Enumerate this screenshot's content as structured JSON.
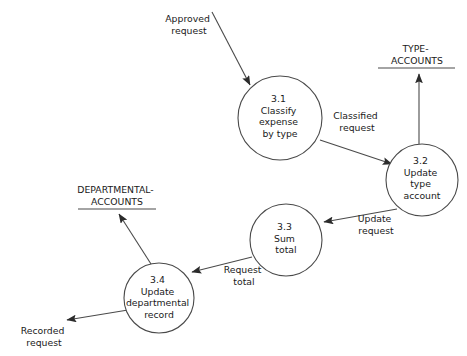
{
  "diagram": {
    "type": "data-flow-diagram",
    "background_color": "#ffffff",
    "line_color": "#4a4a4a",
    "text_color": "#1a1a1a"
  },
  "processes": [
    {
      "id": "3.1",
      "number": "3.1",
      "lines": [
        "3.1",
        "Classify",
        "expense",
        "by type"
      ],
      "cx": 280,
      "cy": 118,
      "r": 42
    },
    {
      "id": "3.2",
      "number": "3.2",
      "lines": [
        "3.2",
        "Update",
        "type",
        "account"
      ],
      "cx": 422,
      "cy": 180,
      "r": 36
    },
    {
      "id": "3.3",
      "number": "3.3",
      "lines": [
        "3.3",
        "Sum",
        "total"
      ],
      "cx": 286,
      "cy": 240,
      "r": 36
    },
    {
      "id": "3.4",
      "number": "3.4",
      "lines": [
        "3.4",
        "Update",
        "departmental",
        "record"
      ],
      "cx": 159,
      "cy": 298,
      "r": 35
    }
  ],
  "data_stores": [
    {
      "id": "type-accounts",
      "lines": [
        "TYPE-",
        "ACCOUNTS"
      ],
      "line_x1": 378,
      "line_x2": 455,
      "line_y": 68
    },
    {
      "id": "departmental-accounts",
      "lines": [
        "DEPARTMENTAL-",
        "ACCOUNTS"
      ],
      "line_x1": 78,
      "line_x2": 156,
      "line_y": 209
    }
  ],
  "flows": [
    {
      "id": "approved-request",
      "lines": [
        "Approved",
        "request"
      ],
      "from": "external",
      "to": "3.1"
    },
    {
      "id": "classified-request",
      "lines": [
        "Classified",
        "request"
      ],
      "from": "3.1",
      "to": "3.2"
    },
    {
      "id": "type-accounts-write",
      "lines": [],
      "from": "3.2",
      "to": "type-accounts"
    },
    {
      "id": "update-request",
      "lines": [
        "Update",
        "request"
      ],
      "from": "3.2",
      "to": "3.3"
    },
    {
      "id": "request-total",
      "lines": [
        "Request",
        "total"
      ],
      "from": "3.3",
      "to": "3.4"
    },
    {
      "id": "departmental-accounts-write",
      "lines": [],
      "from": "3.4",
      "to": "departmental-accounts"
    },
    {
      "id": "recorded-request",
      "lines": [
        "Recorded",
        "request"
      ],
      "from": "3.4",
      "to": "external"
    }
  ]
}
